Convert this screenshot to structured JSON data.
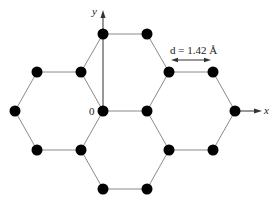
{
  "diagram": {
    "title": "",
    "labels": {
      "x_axis": "x",
      "y_axis": "y",
      "origin": "0",
      "bond_length": "d = 1.42 Å"
    },
    "colors": {
      "atom": "#000000",
      "bond": "#8a8a8a",
      "axis": "#333333",
      "background": "#ffffff"
    },
    "atoms": [
      [
        103,
        34
      ],
      [
        147,
        34
      ],
      [
        37,
        72
      ],
      [
        81,
        72
      ],
      [
        169,
        72
      ],
      [
        213,
        72
      ],
      [
        15,
        111
      ],
      [
        103,
        111
      ],
      [
        147,
        111
      ],
      [
        235,
        111
      ],
      [
        37,
        150
      ],
      [
        81,
        150
      ],
      [
        169,
        150
      ],
      [
        213,
        150
      ],
      [
        103,
        189
      ],
      [
        147,
        189
      ]
    ],
    "bonds": [
      [
        0,
        1
      ],
      [
        0,
        3
      ],
      [
        1,
        4
      ],
      [
        2,
        3
      ],
      [
        2,
        6
      ],
      [
        3,
        7
      ],
      [
        4,
        5
      ],
      [
        4,
        8
      ],
      [
        5,
        9
      ],
      [
        6,
        10
      ],
      [
        7,
        8
      ],
      [
        7,
        11
      ],
      [
        8,
        12
      ],
      [
        9,
        13
      ],
      [
        10,
        11
      ],
      [
        11,
        14
      ],
      [
        12,
        13
      ],
      [
        12,
        15
      ],
      [
        14,
        15
      ]
    ]
  }
}
